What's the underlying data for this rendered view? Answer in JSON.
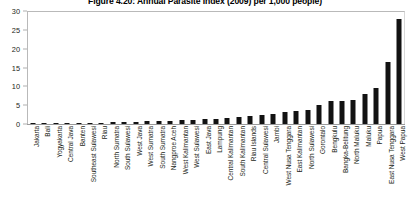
{
  "chart_data": {
    "type": "bar",
    "title": "Figure 4.20: Annual Parasite Index (2009) per 1,000 people)",
    "xlabel": "",
    "ylabel": "",
    "ylim": [
      0,
      30
    ],
    "yticks": [
      0,
      5,
      10,
      15,
      20,
      25,
      30
    ],
    "grid": false,
    "legend": "none",
    "orientation": "vertical",
    "bar_color": "#121212",
    "categories": [
      "Jakarta",
      "Bali",
      "Yogyakarta",
      "Central Java",
      "Banten",
      "Southeast Sulawesi",
      "Riau",
      "North Sumatra",
      "South Sulawesi",
      "West Java",
      "West Sumatra",
      "South Sumatra",
      "Nangproe Aceh",
      "West Kalimantan",
      "West Sulawesi",
      "East Java",
      "Lampung",
      "Central Kalimantan",
      "South Kalimantan",
      "Riau Islands",
      "Central Sulawesi",
      "Jambi",
      "West Nusa Tenggara",
      "East Kalimantan",
      "North Sulawesi",
      "Gorontalo",
      "Bengkulu",
      "Bangka-Belitung",
      "North Maluku",
      "Maluku",
      "Papua",
      "East Nusa Tenggara",
      "West Papua"
    ],
    "values": [
      0.1,
      0.2,
      0.2,
      0.3,
      0.3,
      0.4,
      0.4,
      0.5,
      0.5,
      0.6,
      0.7,
      0.8,
      0.9,
      1.0,
      1.1,
      1.2,
      1.4,
      1.6,
      1.8,
      2.0,
      2.3,
      2.6,
      3.2,
      3.5,
      3.6,
      5.0,
      6.0,
      6.2,
      6.4,
      8.0,
      9.5,
      16.5,
      28.0
    ]
  }
}
